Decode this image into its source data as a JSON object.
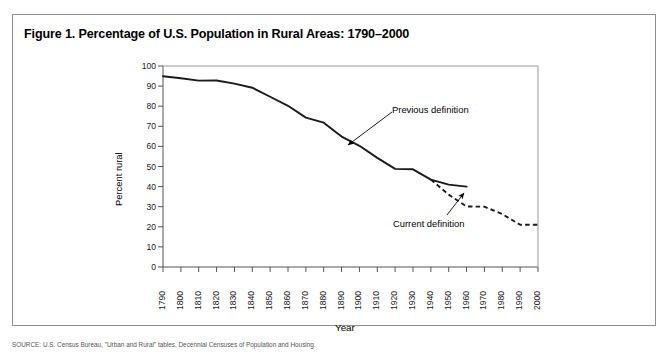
{
  "figure": {
    "title": "Figure 1. Percentage of U.S. Population in Rural Areas: 1790–2000",
    "border_color": "#8f8f8f",
    "background": "#ffffff"
  },
  "source_note": "SOURCE: U.S. Census Bureau, \"Urban and Rural\" tables, Decennial Censuses of Population and Housing.",
  "chart_data": {
    "type": "line",
    "title": "Figure 1. Percentage of U.S. Population in Rural Areas: 1790–2000",
    "xlabel": "Year",
    "ylabel": "Percent rural",
    "xlim": [
      1790,
      2000
    ],
    "ylim": [
      0,
      100
    ],
    "ytick_step": 10,
    "xtick_step": 10,
    "grid": false,
    "legend_position": "none",
    "yticks": [
      0,
      10,
      20,
      30,
      40,
      50,
      60,
      70,
      80,
      90,
      100
    ],
    "xticks": [
      1790,
      1800,
      1810,
      1820,
      1830,
      1840,
      1850,
      1860,
      1870,
      1880,
      1890,
      1900,
      1910,
      1920,
      1930,
      1940,
      1950,
      1960,
      1970,
      1980,
      1990,
      2000
    ],
    "series": [
      {
        "name": "Previous definition",
        "style": "solid",
        "color": "#1a1a1a",
        "x": [
          1790,
          1800,
          1810,
          1820,
          1830,
          1840,
          1850,
          1860,
          1870,
          1880,
          1890,
          1900,
          1910,
          1920,
          1930,
          1940,
          1950,
          1960
        ],
        "values": [
          94.9,
          93.9,
          92.7,
          92.8,
          91.2,
          89.2,
          84.7,
          80.2,
          74.3,
          71.8,
          64.9,
          60.3,
          54.3,
          48.8,
          48.6,
          43.5,
          41.0,
          40.0
        ]
      },
      {
        "name": "Current definition",
        "style": "dashed",
        "color": "#1a1a1a",
        "x": [
          1940,
          1950,
          1960,
          1970,
          1980,
          1990,
          2000
        ],
        "values": [
          43.5,
          36.0,
          30.1,
          30.0,
          26.3,
          21.0,
          21.0
        ]
      }
    ],
    "annotations": [
      {
        "label": "Previous definition",
        "target_x": 1900,
        "target_y": 60.3
      },
      {
        "label": "Current definition",
        "target_x": 1947,
        "target_y": 37.5
      }
    ]
  }
}
